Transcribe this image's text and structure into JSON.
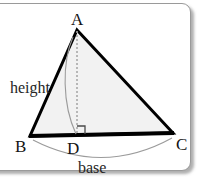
{
  "figure": {
    "kind": "geometry-diagram",
    "panel": {
      "background_color": "#ffffff",
      "border_color": "#9a9a9a",
      "shadow_color": "#6e6e6e",
      "corner_radius_px": 9
    },
    "triangle": {
      "name": "ABC",
      "fill_color": "#f2f2f2",
      "stroke_color": "#000000",
      "stroke_width_px": 3,
      "vertices": [
        {
          "label": "A",
          "x": 77,
          "y": 30,
          "role": "apex"
        },
        {
          "label": "B",
          "x": 30,
          "y": 136,
          "role": "base-left"
        },
        {
          "label": "C",
          "x": 173,
          "y": 133,
          "role": "base-right"
        }
      ]
    },
    "foot_point": {
      "label": "D",
      "x": 77,
      "y": 135,
      "role": "foot-of-altitude"
    },
    "altitude": {
      "from": "A",
      "to": "D",
      "style": "dashed",
      "stroke_color": "#a8a8a8",
      "dash_pattern": "2 2"
    },
    "right_angle_marker": {
      "at": "D",
      "size_px": 8,
      "stroke_color": "#4a4a4a"
    },
    "height_leader": {
      "style": "thin-curve",
      "stroke_color": "#9b9b9b",
      "from_x": 73,
      "from_y": 37,
      "to_x": 76,
      "to_y": 134
    },
    "base_arc": {
      "style": "thin-curve",
      "stroke_color": "#9b9b9b",
      "from_x": 33,
      "from_y": 140,
      "to_x": 172,
      "to_y": 138,
      "sag_px": 28
    },
    "labels": {
      "vertex_a": "A",
      "vertex_b": "B",
      "vertex_c": "C",
      "vertex_d": "D",
      "height": "height",
      "base": "base"
    }
  }
}
